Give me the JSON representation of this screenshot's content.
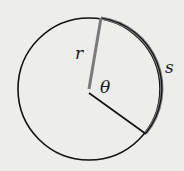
{
  "diagram": {
    "type": "circle-arc-length",
    "labels": {
      "radius": "r",
      "angle": "θ",
      "arc": "s"
    },
    "colors": {
      "background": "#ededeb",
      "circle": "#111111",
      "highlight": "#7a7a7a"
    }
  }
}
